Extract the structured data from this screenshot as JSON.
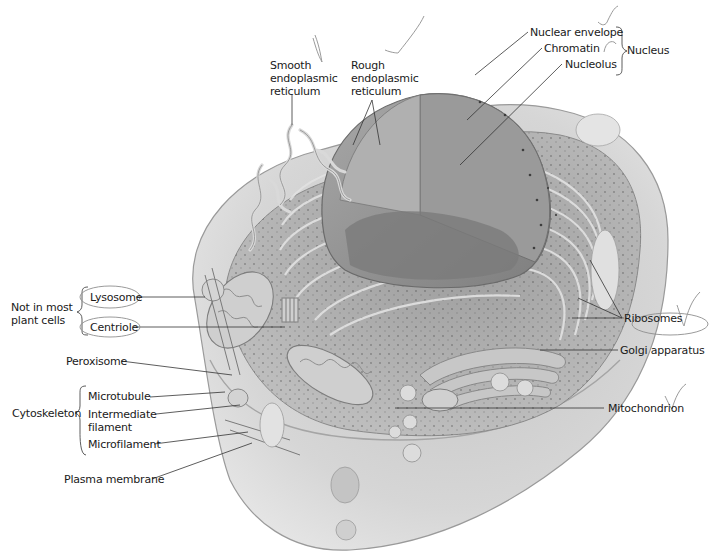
{
  "diagram": {
    "type": "labeled cutaway illustration",
    "colors": {
      "background": "#ffffff",
      "cell_fill": "#d8d8d8",
      "cytoplasm": "#b9b9b9",
      "nucleus": "#8f8f8f",
      "label_text": "#1a1a1a",
      "leader_line": "#333333",
      "pencil_marks": "#9a9a9a"
    }
  },
  "labels": {
    "smooth_er": {
      "line1": "Smooth",
      "line2": "endoplasmic",
      "line3": "reticulum"
    },
    "rough_er": {
      "line1": "Rough",
      "line2": "endoplasmic",
      "line3": "reticulum"
    },
    "nuclear_envelope": "Nuclear envelope",
    "chromatin": "Chromatin",
    "nucleolus": "Nucleolus",
    "nucleus_group": "Nucleus",
    "not_in_plant": {
      "line1": "Not in  most",
      "line2": "plant cells"
    },
    "lysosome": "Lysosome",
    "centriole": "Centriole",
    "peroxisome": "Peroxisome",
    "cytoskeleton_group": "Cytoskeleton",
    "microtubule": "Microtubule",
    "intermediate_filament": {
      "line1": "Intermediate",
      "line2": "filament"
    },
    "microfilament": "Microfilament",
    "plasma_membrane": "Plasma membrane",
    "ribosomes": "Ribosomes",
    "golgi": "Golgi apparatus",
    "mitochondrion": "Mitochondrion"
  },
  "annotations": {
    "pencil_checkmarks": 6,
    "pencil_ovals": [
      "Lysosome",
      "Centriole",
      "Ribosomes"
    ]
  }
}
